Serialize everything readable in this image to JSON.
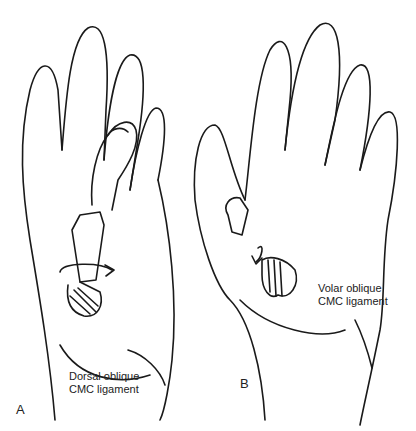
{
  "figure": {
    "panels": [
      {
        "letter": "A",
        "label_line1": "Dorsal oblique",
        "label_line2": "CMC ligament",
        "view": "dorsal hand, thumb flexed across palm"
      },
      {
        "letter": "B",
        "label_line1": "Volar oblique",
        "label_line2": "CMC ligament",
        "view": "volar hand, thumb abducted"
      }
    ],
    "colors": {
      "line": "#1a1a1a",
      "background": "#ffffff",
      "hatch": "#333333"
    }
  }
}
